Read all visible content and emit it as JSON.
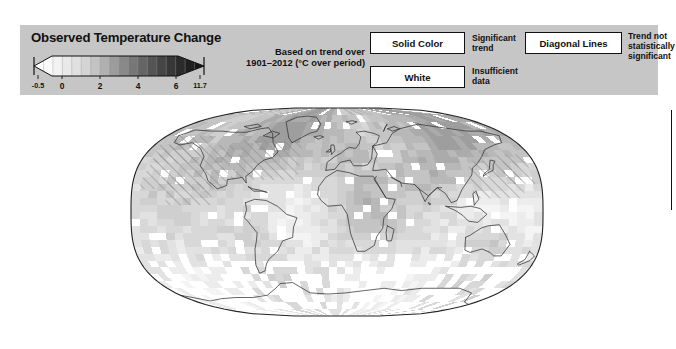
{
  "figure": {
    "title": "Observed Temperature Change",
    "subtitle_line1": "Based on trend over",
    "subtitle_line2": "1901–2012 (°C over period)",
    "panel_bg": "#c6c6c6"
  },
  "colorbar": {
    "units": "°C over period",
    "min_label": "-0.5",
    "max_label": "11.7",
    "tick_labels": [
      "-0.5",
      "0",
      "2",
      "4",
      "6",
      "11.7"
    ],
    "tick_values": [
      -0.5,
      0,
      2,
      4,
      6,
      11.7
    ],
    "segment_colors": [
      "#ffffff",
      "#fafafa",
      "#f2f2f2",
      "#e9e9e9",
      "#e0e0e0",
      "#d4d4d4",
      "#c3c3c3",
      "#b0b0b0",
      "#9c9c9c",
      "#898989",
      "#777777",
      "#656565",
      "#545454",
      "#454545",
      "#373737",
      "#2b2b2b",
      "#1f1f1f",
      "#151515"
    ],
    "left_arrow_color": "#ffffff",
    "right_arrow_color": "#141414",
    "outline_color": "#111111"
  },
  "legend_keys": [
    {
      "box_label": "Solid Color",
      "desc_line1": "Significant",
      "desc_line2": "trend",
      "desc_line3": ""
    },
    {
      "box_label": "White",
      "desc_line1": "Insufficient",
      "desc_line2": "data",
      "desc_line3": ""
    },
    {
      "box_label": "Diagonal Lines",
      "desc_line1": "Trend not",
      "desc_line2": "statistically",
      "desc_line3": "significant"
    }
  ],
  "map": {
    "projection": "Robinson",
    "frame_color": "#222222",
    "coast_color": "#333333",
    "ocean_fill": "#ffffff",
    "hatch_color": "#8a8a8a",
    "grid_cell_shades": [
      "#ffffff",
      "#f4f4f4",
      "#ececec",
      "#e2e2e2",
      "#d8d8d8",
      "#cfcfcf",
      "#c4c4c4",
      "#b8b8b8",
      "#ababab",
      "#9e9e9e"
    ]
  },
  "chart_data": {
    "type": "heatmap",
    "title": "Observed Temperature Change",
    "subtitle": "Based on trend over 1901–2012 (°C over period)",
    "xlabel": "",
    "ylabel": "",
    "colorbar_label": "°C over period",
    "colorbar_ticks": [
      -0.5,
      0,
      2,
      4,
      6,
      11.7
    ],
    "colorbar_tick_labels": [
      "-0.5",
      "0",
      "2",
      "4",
      "6",
      "11.7"
    ],
    "value_range": [
      -0.5,
      11.7
    ],
    "grid": false,
    "legend_position": "top",
    "legend_entries": [
      "Solid Color — Significant trend",
      "White — Insufficient data",
      "Diagonal Lines — Trend not statistically significant"
    ]
  }
}
